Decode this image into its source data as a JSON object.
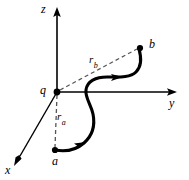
{
  "figure": {
    "type": "physics-vector-diagram",
    "width": 189,
    "height": 180,
    "background_color": "#ffffff",
    "stroke_color": "#000000",
    "axes": [
      {
        "id": "z",
        "label": "z",
        "direction": "up",
        "origin": [
          57,
          92
        ],
        "tip": [
          57,
          9
        ],
        "arrow": true
      },
      {
        "id": "y",
        "label": "y",
        "direction": "right",
        "origin": [
          57,
          92
        ],
        "tip": [
          176,
          92
        ],
        "arrow": true
      },
      {
        "id": "x",
        "label": "x",
        "direction": "down-left",
        "origin": [
          57,
          92
        ],
        "tip": [
          15,
          163
        ],
        "arrow": true
      }
    ],
    "points": [
      {
        "id": "origin",
        "label": "q",
        "x": 57,
        "y": 92,
        "dot": true
      },
      {
        "id": "start",
        "label": "a",
        "x": 55,
        "y": 150,
        "dot": true
      },
      {
        "id": "end",
        "label": "b",
        "x": 140,
        "y": 48,
        "dot": true
      }
    ],
    "dashed_segments": [
      {
        "id": "r_a",
        "label": "r",
        "subscript": "a",
        "from": [
          57,
          92
        ],
        "to": [
          55,
          150
        ]
      },
      {
        "id": "r_b",
        "label": "r",
        "subscript": "b",
        "from": [
          57,
          92
        ],
        "to": [
          139,
          48
        ]
      }
    ],
    "path": {
      "id": "trajectory",
      "from_point": "a",
      "to_point": "b",
      "style": "solid-thick-s-curve",
      "arrowheads": 2
    }
  }
}
